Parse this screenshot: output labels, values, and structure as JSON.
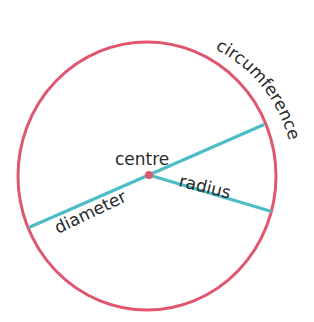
{
  "diagram": {
    "colors": {
      "circle": "#e05670",
      "lines": "#4dbcc6",
      "text": "#2a2a2a",
      "centre_dot": "#e05670"
    },
    "labels": {
      "centre": "centre",
      "radius": "radius",
      "diameter": "diameter",
      "circumference": "circumference"
    }
  }
}
